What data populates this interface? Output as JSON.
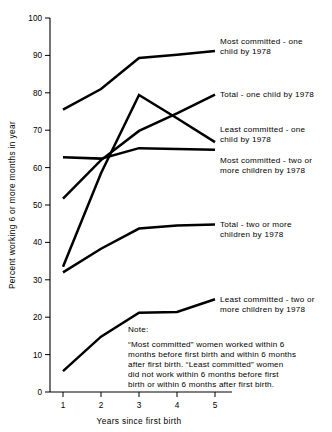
{
  "chart_data": {
    "type": "line",
    "title": "",
    "xlabel": "Years since first birth",
    "ylabel": "Percent working 6 or more months in year",
    "x": [
      1,
      2,
      3,
      4,
      5
    ],
    "xlim": [
      0.55,
      5.45
    ],
    "ylim": [
      0,
      100
    ],
    "yticks": [
      0,
      10,
      20,
      30,
      40,
      50,
      60,
      70,
      80,
      90,
      100
    ],
    "xticks": [
      1,
      2,
      3,
      4,
      5
    ],
    "grid": false,
    "legend_position": "right-inline-annotations",
    "series": [
      {
        "name": "Most committed - one child by 1978",
        "values": [
          75.5,
          81.0,
          89.3,
          90.2,
          91.2
        ],
        "label_lines": [
          "Most committed - one",
          "child by 1978"
        ]
      },
      {
        "name": "Total - one child by 1978",
        "values": [
          51.7,
          62.0,
          69.8,
          74.5,
          79.5
        ],
        "label_lines": [
          "Total - one child by 1978"
        ]
      },
      {
        "name": "Least committed - one child by 1978",
        "values": [
          33.5,
          58.5,
          79.4,
          73.2,
          66.8
        ],
        "label_lines": [
          "Least committed - one",
          "child by 1978"
        ]
      },
      {
        "name": "Most committed - two or more children by 1978",
        "values": [
          62.8,
          62.4,
          65.2,
          65.0,
          64.8
        ],
        "label_lines": [
          "Most committed - two or",
          "more children by 1978"
        ]
      },
      {
        "name": "Total - two or more children by 1978",
        "values": [
          32.0,
          38.3,
          43.7,
          44.5,
          44.8
        ],
        "label_lines": [
          "Total - two or more",
          "children by 1978"
        ]
      },
      {
        "name": "Least committed - two or more children by 1978",
        "values": [
          5.6,
          14.8,
          21.2,
          21.4,
          24.8
        ],
        "label_lines": [
          "Least committed - two or",
          "more children by 1978"
        ]
      }
    ]
  },
  "axes": {
    "ylabel": "Percent working 6 or more months in year",
    "xlabel": "Years since first birth",
    "ytick_labels": [
      "0",
      "10",
      "20",
      "30",
      "40",
      "50",
      "60",
      "70",
      "80",
      "90",
      "100"
    ],
    "xtick_labels": [
      "1",
      "2",
      "3",
      "4",
      "5"
    ]
  },
  "annotations": {
    "s0_line1": "Most committed - one",
    "s0_line2": "child by 1978",
    "s1_line1": "Total - one child by 1978",
    "s2_line1": "Least committed - one",
    "s2_line2": "child by 1978",
    "s3_line1": "Most committed - two or",
    "s3_line2": "more children by 1978",
    "s4_line1": "Total - two or more",
    "s4_line2": "children by 1978",
    "s5_line1": "Least committed - two or",
    "s5_line2": "more children by 1978"
  },
  "note": {
    "heading": "Note:",
    "line1": "“Most committed” women worked within 6",
    "line2": "months before first birth and within 6 months",
    "line3": "after first birth. “Least committed” women",
    "line4": "did not work within 6 months before first",
    "line5": "birth or within 6 months after first birth."
  },
  "colors": {
    "line": "#000000",
    "axis": "#000000",
    "background": "#ffffff"
  }
}
